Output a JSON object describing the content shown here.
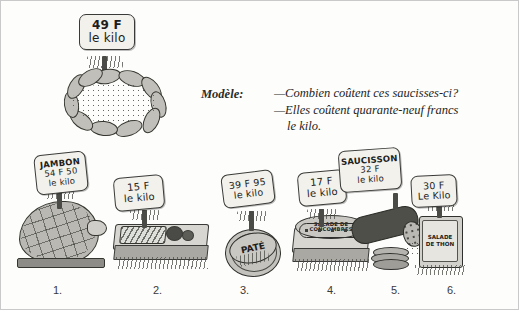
{
  "page": {
    "type": "french-textbook-exercise-illustration",
    "width": 519,
    "height": 310
  },
  "model": {
    "label": "Modèle:",
    "question": "—Combien coûtent ces saucisses-ci?",
    "answer_line1": "—Elles coûtent quarante-neuf francs",
    "answer_line2": "le kilo."
  },
  "model_sign": {
    "name": "saucisses",
    "line1": "49 F",
    "line2": "le kilo"
  },
  "items": [
    {
      "number": "1.",
      "product_label": "JAMBON",
      "sign_line1": "JAMBON",
      "sign_line2": "54 F 50",
      "sign_line3": "le kilo",
      "illustration": "whole-ham-in-netting"
    },
    {
      "number": "2.",
      "product_label": "",
      "sign_line1": "",
      "sign_line2": "15 F",
      "sign_line3": "le kilo",
      "illustration": "tray-of-olives-and-charcuterie"
    },
    {
      "number": "3.",
      "product_label": "PATÉ",
      "sign_line1": "",
      "sign_line2": "39 F 95",
      "sign_line3": "le kilo",
      "illustration": "round-pate-terrine"
    },
    {
      "number": "4.",
      "product_label": "SALADE DE CONCOMBRES",
      "sign_line1": "",
      "sign_line2": "17 F",
      "sign_line3": "le kilo",
      "illustration": "cucumber-salad-dish"
    },
    {
      "number": "5.",
      "product_label": "SAUCISSON",
      "sign_line1": "SAUCISSON",
      "sign_line2": "32 F",
      "sign_line3": "le kilo",
      "illustration": "dry-sausage-with-slices"
    },
    {
      "number": "6.",
      "product_label": "SALADE DE THON",
      "sign_line1": "",
      "sign_line2": "30 F",
      "sign_line3": "Le Kilo",
      "illustration": "tuna-salad-can"
    }
  ],
  "colors": {
    "ink": "#1d1d1b",
    "sign_fill": "#f2f1ec",
    "sign_border": "#3a3a38",
    "illustration_fill": "#bdbdb8",
    "page_bg": "#fdfdfb"
  }
}
